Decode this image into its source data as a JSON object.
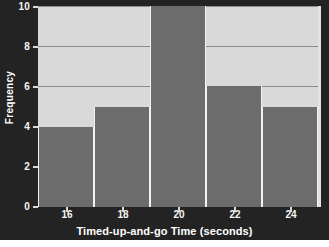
{
  "chart_data": {
    "type": "bar",
    "title": "",
    "subtitle": "",
    "xlabel": "Timed-up-and-go Time (seconds)",
    "ylabel": "Frequency",
    "xlim": [
      15,
      25
    ],
    "ylim": [
      0,
      10
    ],
    "xticks": [
      16,
      18,
      20,
      22,
      24
    ],
    "xtick_labels": [
      "16",
      "18",
      "20",
      "22",
      "24"
    ],
    "yticks": [
      0,
      2,
      4,
      6,
      8,
      10
    ],
    "ytick_labels": [
      "0",
      "2",
      "4",
      "6",
      "8",
      "10"
    ],
    "grid": "horizontal",
    "legend": "none",
    "bin_edges": [
      15,
      17,
      19,
      21,
      23,
      25
    ],
    "bin_width": 2,
    "categories": [
      "15-17",
      "17-19",
      "19-21",
      "21-23",
      "23-25"
    ],
    "values": [
      4,
      5,
      10,
      6,
      5
    ],
    "bars": [
      {
        "label": "15-17",
        "start": 15,
        "end": 17,
        "value": 4
      },
      {
        "label": "17-19",
        "start": 17,
        "end": 19,
        "value": 5
      },
      {
        "label": "19-21",
        "start": 19,
        "end": 21,
        "value": 10
      },
      {
        "label": "21-23",
        "start": 21,
        "end": 23,
        "value": 6
      },
      {
        "label": "23-25",
        "start": 23,
        "end": 25,
        "value": 5
      }
    ],
    "colors": {
      "bar_fill": "#6c6c6c",
      "bar_edge": "#f2f2f2",
      "plot_background": "#d9d9d9",
      "figure_background": "#232323",
      "gridline": "#8d8d8d",
      "axis_text": "#f4f4f4",
      "outer_background": "#ffffff"
    }
  }
}
